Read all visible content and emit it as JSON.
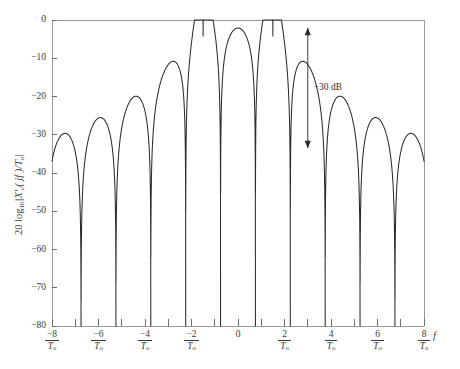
{
  "figure": {
    "background_color": "#ffffff",
    "curve_color": "#2b2b2b",
    "axis_color": "#9a9a9a"
  },
  "axes": {
    "y_title_prefix": "20 log",
    "y_title_sub": "10",
    "y_title_mid": "|X'",
    "y_title_sub2": "c",
    "y_title_rest": "( jf )/T",
    "y_title_sub3": "o",
    "y_title_end": "|",
    "x_title": "f"
  },
  "annotation": {
    "label": "−30 dB",
    "from_db": -2.0,
    "to_db": -33.5,
    "at_x": 3.0
  },
  "y_ticks": [
    {
      "value": 0,
      "label": "0"
    },
    {
      "value": -10,
      "label": "−10"
    },
    {
      "value": -20,
      "label": "−20"
    },
    {
      "value": -30,
      "label": "−30"
    },
    {
      "value": -40,
      "label": "−40"
    },
    {
      "value": -50,
      "label": "−50"
    },
    {
      "value": -60,
      "label": "−60"
    },
    {
      "value": -70,
      "label": "−70"
    },
    {
      "value": -80,
      "label": "−80"
    }
  ],
  "x_ticks": [
    {
      "value": -8,
      "num": "−8",
      "den": "T",
      "den_sub": "o",
      "fraction": true
    },
    {
      "value": -7,
      "num": "",
      "den": "",
      "den_sub": "",
      "fraction": false
    },
    {
      "value": -6,
      "num": "−6",
      "den": "T",
      "den_sub": "o",
      "fraction": true
    },
    {
      "value": -5,
      "num": "",
      "den": "",
      "den_sub": "",
      "fraction": false
    },
    {
      "value": -4,
      "num": "−4",
      "den": "T",
      "den_sub": "o",
      "fraction": true
    },
    {
      "value": -3,
      "num": "",
      "den": "",
      "den_sub": "",
      "fraction": false
    },
    {
      "value": -2,
      "num": "−2",
      "den": "T",
      "den_sub": "o",
      "fraction": true
    },
    {
      "value": -1,
      "num": "",
      "den": "",
      "den_sub": "",
      "fraction": false
    },
    {
      "value": 0,
      "num": "0",
      "den": "",
      "den_sub": "",
      "fraction": false
    },
    {
      "value": 1,
      "num": "",
      "den": "",
      "den_sub": "",
      "fraction": false
    },
    {
      "value": 2,
      "num": "2",
      "den": "T",
      "den_sub": "o",
      "fraction": true
    },
    {
      "value": 3,
      "num": "",
      "den": "",
      "den_sub": "",
      "fraction": false
    },
    {
      "value": 4,
      "num": "4",
      "den": "T",
      "den_sub": "o",
      "fraction": true
    },
    {
      "value": 5,
      "num": "",
      "den": "",
      "den_sub": "",
      "fraction": false
    },
    {
      "value": 6,
      "num": "6",
      "den": "T",
      "den_sub": "o",
      "fraction": true
    },
    {
      "value": 7,
      "num": "",
      "den": "",
      "den_sub": "",
      "fraction": false
    },
    {
      "value": 8,
      "num": "8",
      "den": "T",
      "den_sub": "o",
      "fraction": true
    }
  ],
  "chart_data": {
    "type": "line",
    "title": "",
    "subtitle": "",
    "xlabel": "f",
    "ylabel": "20 log10|X'c( jf )/To|",
    "xlim": [
      -8,
      8
    ],
    "ylim": [
      -80,
      0
    ],
    "xtick_values": [
      -8,
      -7,
      -6,
      -5,
      -4,
      -3,
      -2,
      -1,
      0,
      1,
      2,
      3,
      4,
      5,
      6,
      7,
      8
    ],
    "xtick_labels": [
      "-8/To",
      "",
      "-6/To",
      "",
      "-4/To",
      "",
      "-2/To",
      "",
      "0",
      "",
      "2/To",
      "",
      "4/To",
      "",
      "6/To",
      "",
      "8/To"
    ],
    "ytick_values": [
      0,
      -10,
      -20,
      -30,
      -40,
      -50,
      -60,
      -70,
      -80
    ],
    "ytick_labels": [
      "0",
      "-10",
      "-20",
      "-30",
      "-40",
      "-50",
      "-60",
      "-70",
      "-80"
    ],
    "grid": false,
    "legend": false,
    "y_units": "dB",
    "x_units": "1/To",
    "series": [
      {
        "name": "MSK power spectral density",
        "color": "#2b2b2b",
        "main_lobe_peak_db": -2.1,
        "main_lobe_peak_x": 0,
        "nulls_x": [
          -7.5,
          -6.5,
          -5.5,
          -4.5,
          -3.5,
          -2.5,
          -1.5,
          1.5,
          2.5,
          3.5,
          4.5,
          5.5,
          6.5,
          7.5
        ],
        "sidelobe_peaks": [
          {
            "x": -7.0,
            "y_db": -65.0
          },
          {
            "x": -6.0,
            "y_db": -60.0
          },
          {
            "x": -5.0,
            "y_db": -56.0
          },
          {
            "x": -4.0,
            "y_db": -50.0
          },
          {
            "x": -3.0,
            "y_db": -43.5
          },
          {
            "x": -2.0,
            "y_db": -33.5
          },
          {
            "x": 2.0,
            "y_db": -33.5
          },
          {
            "x": 3.0,
            "y_db": -43.5
          },
          {
            "x": 4.0,
            "y_db": -50.0
          },
          {
            "x": 5.0,
            "y_db": -56.0
          },
          {
            "x": 6.0,
            "y_db": -60.0
          },
          {
            "x": 7.0,
            "y_db": -65.0
          }
        ]
      }
    ],
    "annotations": [
      {
        "text": "-30 dB",
        "type": "double-arrow",
        "x": 3.0,
        "y_from_db": -2.0,
        "y_to_db": -33.5
      }
    ]
  }
}
